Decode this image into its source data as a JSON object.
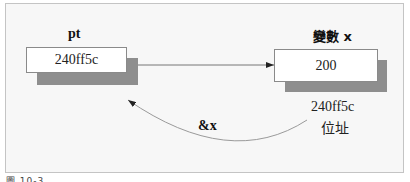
{
  "diagram": {
    "pointer": {
      "name": "pt",
      "value": "240ff5c"
    },
    "variable": {
      "name": "變數 x",
      "value": "200",
      "address_value": "240ff5c",
      "address_label": "位址"
    },
    "reference_label": "&x",
    "caption": "圖 10-3",
    "colors": {
      "box_fill": "#ffffff",
      "box_border": "#8a8a8a",
      "shadow": "#8e8e8e",
      "frame_bg": "#f7f7f7",
      "frame_border": "#c4c4c4",
      "arrow": "#555555",
      "curve": "#9a9a9a"
    }
  }
}
